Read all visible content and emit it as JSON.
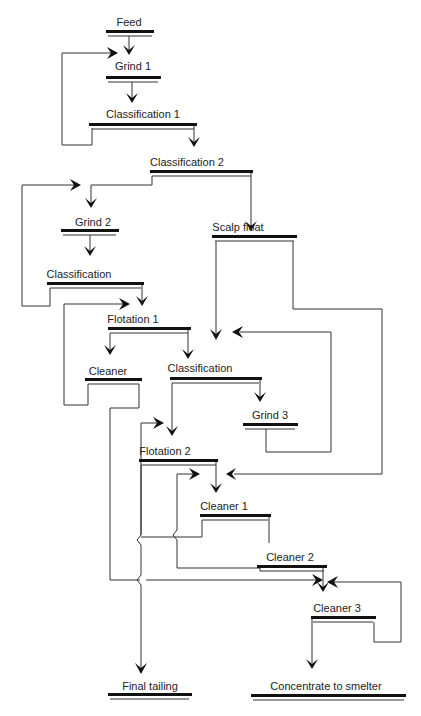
{
  "diagram": {
    "type": "process-flowsheet",
    "nodes": {
      "feed": {
        "label": "Feed"
      },
      "grind1": {
        "label": "Grind 1"
      },
      "classification1": {
        "label": "Classification 1"
      },
      "classification2": {
        "label": "Classification 2"
      },
      "grind2": {
        "label": "Grind 2"
      },
      "scalp_float": {
        "label": "Scalp float"
      },
      "classification_a": {
        "label": "Classification"
      },
      "flotation1": {
        "label": "Flotation 1"
      },
      "cleaner": {
        "label": "Cleaner"
      },
      "classification_b": {
        "label": "Classification"
      },
      "grind3": {
        "label": "Grind 3"
      },
      "flotation2": {
        "label": "Flotation 2"
      },
      "cleaner1": {
        "label": "Cleaner 1"
      },
      "cleaner2": {
        "label": "Cleaner 2"
      },
      "cleaner3": {
        "label": "Cleaner 3"
      },
      "final_tailing": {
        "label": "Final tailing"
      },
      "concentrate": {
        "label": "Concentrate to smelter"
      }
    },
    "edges": [
      {
        "from": "Feed",
        "to": "Grind 1"
      },
      {
        "from": "Grind 1",
        "to": "Classification 1"
      },
      {
        "from": "Classification 1",
        "to": "Grind 1",
        "note": "recycle loop"
      },
      {
        "from": "Classification 1",
        "to": "Classification 2"
      },
      {
        "from": "Classification 2",
        "to": "Grind 2"
      },
      {
        "from": "Classification 2",
        "to": "Scalp float"
      },
      {
        "from": "Grind 2",
        "to": "Classification"
      },
      {
        "from": "Classification",
        "to": "Grind 2",
        "note": "recycle loop"
      },
      {
        "from": "Classification",
        "to": "Flotation 1"
      },
      {
        "from": "Cleaner",
        "to": "Flotation 1",
        "note": "recycle"
      },
      {
        "from": "Flotation 1",
        "to": "Cleaner"
      },
      {
        "from": "Flotation 1",
        "to": "Classification (2nd)"
      },
      {
        "from": "Scalp float",
        "to": "Classification (2nd)"
      },
      {
        "from": "Scalp float",
        "to": "Flotation 2 product"
      },
      {
        "from": "Classification (2nd)",
        "to": "Grind 3"
      },
      {
        "from": "Classification (2nd)",
        "to": "Flotation 2"
      },
      {
        "from": "Grind 3",
        "to": "Classification (2nd)",
        "note": "recycle"
      },
      {
        "from": "Flotation 2",
        "to": "Cleaner 1"
      },
      {
        "from": "Flotation 2",
        "to": "Final tailing"
      },
      {
        "from": "Cleaner 1",
        "to": "Flotation 2",
        "note": "tail recycle"
      },
      {
        "from": "Cleaner 1",
        "to": "Cleaner 2"
      },
      {
        "from": "Cleaner 2",
        "to": "Cleaner 1",
        "note": "recycle"
      },
      {
        "from": "Cleaner 2",
        "to": "Cleaner 3"
      },
      {
        "from": "Cleaner",
        "to": "Cleaner 3"
      },
      {
        "from": "Cleaner 3",
        "to": "Cleaner 3",
        "note": "recycle"
      },
      {
        "from": "Cleaner 3",
        "to": "Concentrate to smelter"
      }
    ]
  }
}
